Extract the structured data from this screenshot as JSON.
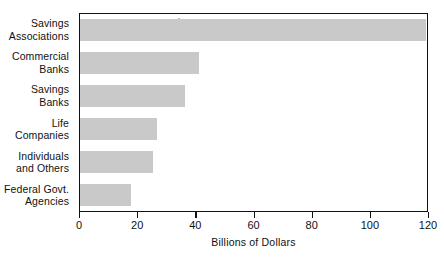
{
  "chart_data": {
    "type": "bar",
    "orientation": "horizontal",
    "title": "",
    "xlabel": "Billions of Dollars",
    "ylabel": "",
    "categories": [
      "Savings\nAssociations",
      "Commercial\nBanks",
      "Savings\nBanks",
      "Life\nCompanies",
      "Individuals\nand Others",
      "Federal Govt.\nAgencies"
    ],
    "values": [
      119,
      41,
      36,
      26.5,
      25,
      17.5
    ],
    "xlim": [
      0,
      120
    ],
    "xticks": [
      0,
      20,
      40,
      60,
      80,
      100,
      120
    ],
    "xtick_labels": [
      "0",
      "20",
      "40",
      "60",
      "80",
      "100",
      "120"
    ],
    "grid": false,
    "legend": false,
    "bar_color": "#c9c9c9",
    "axis_color": "#111111"
  }
}
